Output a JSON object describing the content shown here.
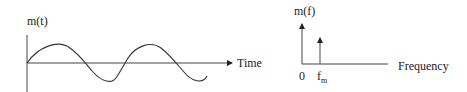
{
  "time_domain": {
    "ylabel": "m(t)",
    "xlabel": "Time",
    "waveform": "sine",
    "cycles": 2
  },
  "frequency_domain": {
    "ylabel": "m(f)",
    "xlabel": "Frequency",
    "origin_label": "0",
    "spike_label_main": "f",
    "spike_label_sub": "m"
  },
  "colors": {
    "line": "#333333",
    "background": "#ffffff"
  }
}
